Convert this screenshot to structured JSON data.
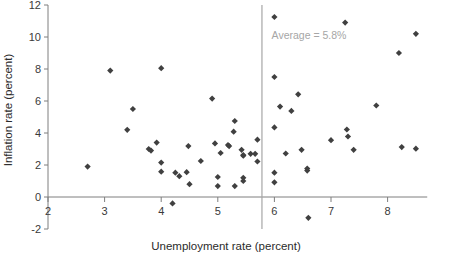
{
  "chart_data": {
    "type": "scatter",
    "title": "",
    "xlabel": "Unemployment rate (percent)",
    "ylabel": "Inflation rate (percent)",
    "xlim": [
      2,
      8.7
    ],
    "ylim": [
      -2,
      12
    ],
    "xticks": [
      2,
      3,
      4,
      5,
      6,
      7,
      8
    ],
    "yticks": [
      -2,
      0,
      2,
      4,
      6,
      8,
      10,
      12
    ],
    "xtick_labels": [
      "2",
      "3",
      "4",
      "5",
      "6",
      "7",
      "8"
    ],
    "ytick_labels": [
      "-2",
      "0",
      "2",
      "4",
      "6",
      "8",
      "10",
      "12"
    ],
    "grid": false,
    "legend": null,
    "marker": "diamond",
    "marker_color": "#404040",
    "annotations": [
      {
        "name": "average-line-label",
        "text": "Average = 5.8%",
        "x": 5.95,
        "y": 9.9,
        "color": "#a6a6a6"
      }
    ],
    "reference_lines": [
      {
        "name": "average-unemployment-line",
        "orientation": "vertical",
        "x": 5.78,
        "value_label": "Average = 5.8%",
        "color": "#a6a6a6"
      }
    ],
    "points": [
      [
        2.7,
        1.9
      ],
      [
        3.1,
        7.9
      ],
      [
        3.4,
        4.2
      ],
      [
        3.5,
        5.5
      ],
      [
        3.78,
        3.0
      ],
      [
        3.82,
        2.9
      ],
      [
        3.92,
        3.4
      ],
      [
        4.0,
        8.05
      ],
      [
        4.0,
        2.15
      ],
      [
        4.0,
        1.58
      ],
      [
        4.2,
        -0.4
      ],
      [
        4.25,
        1.52
      ],
      [
        4.32,
        1.3
      ],
      [
        4.45,
        1.55
      ],
      [
        4.48,
        3.18
      ],
      [
        4.5,
        0.8
      ],
      [
        4.7,
        2.25
      ],
      [
        4.9,
        6.15
      ],
      [
        4.95,
        3.35
      ],
      [
        5.0,
        1.25
      ],
      [
        5.0,
        0.68
      ],
      [
        5.05,
        2.75
      ],
      [
        5.18,
        3.25
      ],
      [
        5.2,
        3.18
      ],
      [
        5.28,
        4.08
      ],
      [
        5.3,
        4.75
      ],
      [
        5.3,
        0.68
      ],
      [
        5.42,
        2.95
      ],
      [
        5.45,
        2.62
      ],
      [
        5.45,
        2.58
      ],
      [
        5.45,
        1.2
      ],
      [
        5.45,
        1.0
      ],
      [
        5.58,
        2.7
      ],
      [
        5.66,
        2.7
      ],
      [
        5.7,
        3.58
      ],
      [
        5.7,
        2.22
      ],
      [
        6.0,
        11.25
      ],
      [
        6.0,
        7.5
      ],
      [
        6.0,
        4.35
      ],
      [
        6.0,
        1.52
      ],
      [
        6.0,
        0.92
      ],
      [
        6.1,
        5.65
      ],
      [
        6.2,
        2.72
      ],
      [
        6.3,
        5.38
      ],
      [
        6.42,
        6.42
      ],
      [
        6.48,
        2.95
      ],
      [
        6.58,
        1.78
      ],
      [
        6.58,
        1.65
      ],
      [
        6.6,
        -1.3
      ],
      [
        7.0,
        3.55
      ],
      [
        7.25,
        10.9
      ],
      [
        7.28,
        4.22
      ],
      [
        7.3,
        3.78
      ],
      [
        7.4,
        2.95
      ],
      [
        7.8,
        5.72
      ],
      [
        8.2,
        9.0
      ],
      [
        8.25,
        3.12
      ],
      [
        8.5,
        10.2
      ],
      [
        8.5,
        3.02
      ]
    ]
  },
  "axes": {
    "x_axis_title": "Unemployment rate (percent)",
    "y_axis_title": "Inflation rate (percent)"
  }
}
